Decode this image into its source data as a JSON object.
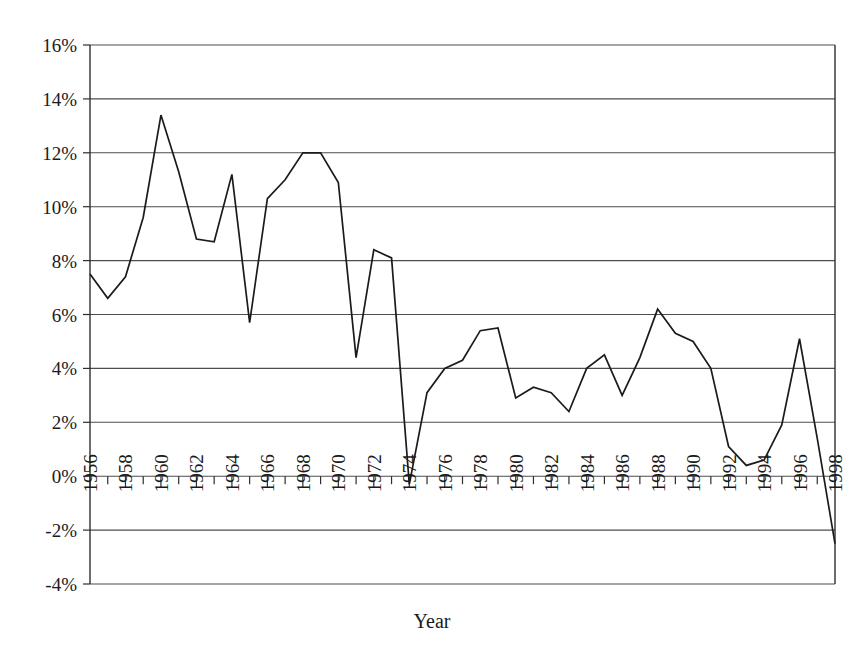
{
  "chart_data": {
    "type": "line",
    "title": "",
    "xlabel": "Year",
    "ylabel": "",
    "grid": true,
    "legend": "none",
    "xlim": [
      1956,
      1998
    ],
    "ylim": [
      -4,
      16
    ],
    "ytick_labels": [
      "16%",
      "14%",
      "12%",
      "10%",
      "8%",
      "6%",
      "4%",
      "2%",
      "0%",
      "-2%",
      "-4%"
    ],
    "ytick_values": [
      16,
      14,
      12,
      10,
      8,
      6,
      4,
      2,
      0,
      -2,
      -4
    ],
    "xtick_labels": [
      "1956",
      "1958",
      "1960",
      "1962",
      "1964",
      "1966",
      "1968",
      "1970",
      "1972",
      "1974",
      "1976",
      "1978",
      "1980",
      "1982",
      "1984",
      "1986",
      "1988",
      "1990",
      "1992",
      "1994",
      "1996",
      "1998"
    ],
    "xtick_values": [
      1956,
      1958,
      1960,
      1962,
      1964,
      1966,
      1968,
      1970,
      1972,
      1974,
      1976,
      1978,
      1980,
      1982,
      1984,
      1986,
      1988,
      1990,
      1992,
      1994,
      1996,
      1998
    ],
    "minor_tick_interval": 1,
    "x": [
      1956,
      1957,
      1958,
      1959,
      1960,
      1961,
      1962,
      1963,
      1964,
      1965,
      1966,
      1967,
      1968,
      1969,
      1970,
      1971,
      1972,
      1973,
      1974,
      1975,
      1976,
      1977,
      1978,
      1979,
      1980,
      1981,
      1982,
      1983,
      1984,
      1985,
      1986,
      1987,
      1988,
      1989,
      1990,
      1991,
      1992,
      1993,
      1994,
      1995,
      1996,
      1997,
      1998
    ],
    "values": [
      7.5,
      6.6,
      7.4,
      9.6,
      13.4,
      11.3,
      8.8,
      8.7,
      11.2,
      5.7,
      10.3,
      11.0,
      12.0,
      12.0,
      10.9,
      4.4,
      8.4,
      8.1,
      -0.3,
      3.1,
      4.0,
      4.3,
      5.4,
      5.5,
      2.9,
      3.3,
      3.1,
      2.4,
      4.0,
      4.5,
      3.0,
      4.4,
      6.2,
      5.3,
      5.0,
      4.0,
      1.1,
      0.4,
      0.6,
      1.9,
      5.1,
      1.4,
      -2.5
    ],
    "line_color": "#1b1b1b"
  }
}
